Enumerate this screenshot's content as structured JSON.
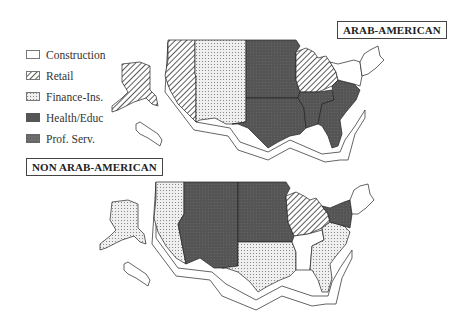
{
  "legend": {
    "items": [
      {
        "key": "construction",
        "label": "Construction",
        "fill": "#ffffff",
        "pattern": "none"
      },
      {
        "key": "retail",
        "label": "Retail",
        "fill": "#ffffff",
        "pattern": "diagonal-stripes"
      },
      {
        "key": "finance",
        "label": "Finance-Ins.",
        "fill": "#e8e8e8",
        "pattern": "dots"
      },
      {
        "key": "health",
        "label": "Health/Educ",
        "fill": "#5a5a5a",
        "pattern": "solid"
      },
      {
        "key": "prof",
        "label": "Prof. Serv.",
        "fill": "#707070",
        "pattern": "dark-dots"
      }
    ]
  },
  "maps": [
    {
      "title": "ARAB-AMERICAN",
      "regions": {
        "pacific": "retail",
        "alaska_hawaii": "retail",
        "mountain": "finance",
        "west_north_central": "health",
        "west_south_central": "health",
        "east_north_central": "retail",
        "east_south_central": "health",
        "south_atlantic": "health",
        "middle_atlantic": "construction",
        "new_england": "construction"
      }
    },
    {
      "title": "NON ARAB-AMERICAN",
      "regions": {
        "pacific": "finance",
        "alaska_hawaii": "finance",
        "mountain": "health",
        "west_north_central": "health",
        "west_south_central": "finance",
        "east_north_central": "retail",
        "east_south_central": "construction",
        "south_atlantic": "finance",
        "middle_atlantic": "health",
        "new_england": "construction"
      }
    }
  ]
}
